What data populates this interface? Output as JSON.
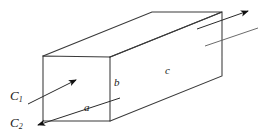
{
  "figure": {
    "kind": "geometry-diagram",
    "background_color": "#ffffff",
    "line_color": "#333333",
    "label_color": "#1a1a1a"
  },
  "labels": {
    "edge_a": "a",
    "edge_b": "b",
    "edge_c": "c",
    "flow_c1_base": "C",
    "flow_c1_sub": "1",
    "flow_c2_base": "C",
    "flow_c2_sub": "2"
  },
  "geometry": {
    "front_face": {
      "top_left": [
        43,
        56
      ],
      "top_right": [
        110,
        57
      ],
      "bottom_right": [
        110,
        121
      ],
      "bottom_left": [
        43,
        121
      ]
    },
    "back_face": {
      "top_left": [
        152,
        12
      ],
      "top_right": [
        222,
        12
      ],
      "bottom_right": [
        222,
        76
      ]
    },
    "depth_offset": [
      109,
      -44
    ]
  },
  "arrows": {
    "inlet_upper": {
      "name": "C1-inlet-arrow",
      "from": [
        28,
        104
      ],
      "to": [
        77,
        79
      ],
      "head": "filled-triangle"
    },
    "inlet_lower": {
      "name": "C2-flow-line",
      "from": [
        118,
        99
      ],
      "to": [
        36,
        126
      ],
      "head": "filled-triangle"
    },
    "outlet_upper": {
      "name": "outlet-arrow",
      "from": [
        199,
        28
      ],
      "to": [
        250,
        10
      ],
      "head": "filled-triangle"
    },
    "outlet_lower": {
      "name": "outlet-line",
      "from": [
        207,
        45
      ],
      "to": [
        256,
        29
      ],
      "head": "none"
    }
  },
  "label_positions": {
    "a": [
      84,
      104
    ],
    "b": [
      114,
      79
    ],
    "c": [
      165,
      67
    ],
    "c1": [
      10,
      90
    ],
    "c2": [
      10,
      117
    ]
  }
}
